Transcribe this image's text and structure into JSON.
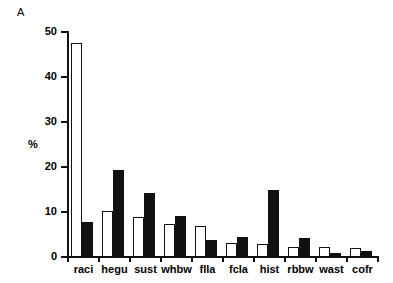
{
  "figure": {
    "panel_label": "A"
  },
  "chart_data": {
    "type": "bar",
    "title": "",
    "xlabel": "",
    "ylabel": "%",
    "ylim": [
      0,
      50
    ],
    "yticks": [
      0,
      10,
      20,
      30,
      40,
      50
    ],
    "ytick_labels": [
      "0",
      "10",
      "20",
      "30",
      "40",
      "50"
    ],
    "grid": false,
    "legend": "none",
    "categories": [
      "raci",
      "hegu",
      "sust",
      "whbw",
      "flla",
      "fcla",
      "hist",
      "rbbw",
      "wast",
      "cofr"
    ],
    "series": [
      {
        "name": "white",
        "fill": "#ffffff",
        "edge": "#111111",
        "values": [
          47.6,
          10.3,
          8.8,
          7.3,
          6.9,
          3.1,
          2.8,
          2.2,
          2.2,
          2.0
        ]
      },
      {
        "name": "black",
        "fill": "#111111",
        "edge": "#111111",
        "values": [
          7.8,
          19.4,
          14.3,
          9.2,
          3.7,
          4.4,
          14.8,
          4.3,
          1.0,
          1.3
        ]
      }
    ]
  }
}
